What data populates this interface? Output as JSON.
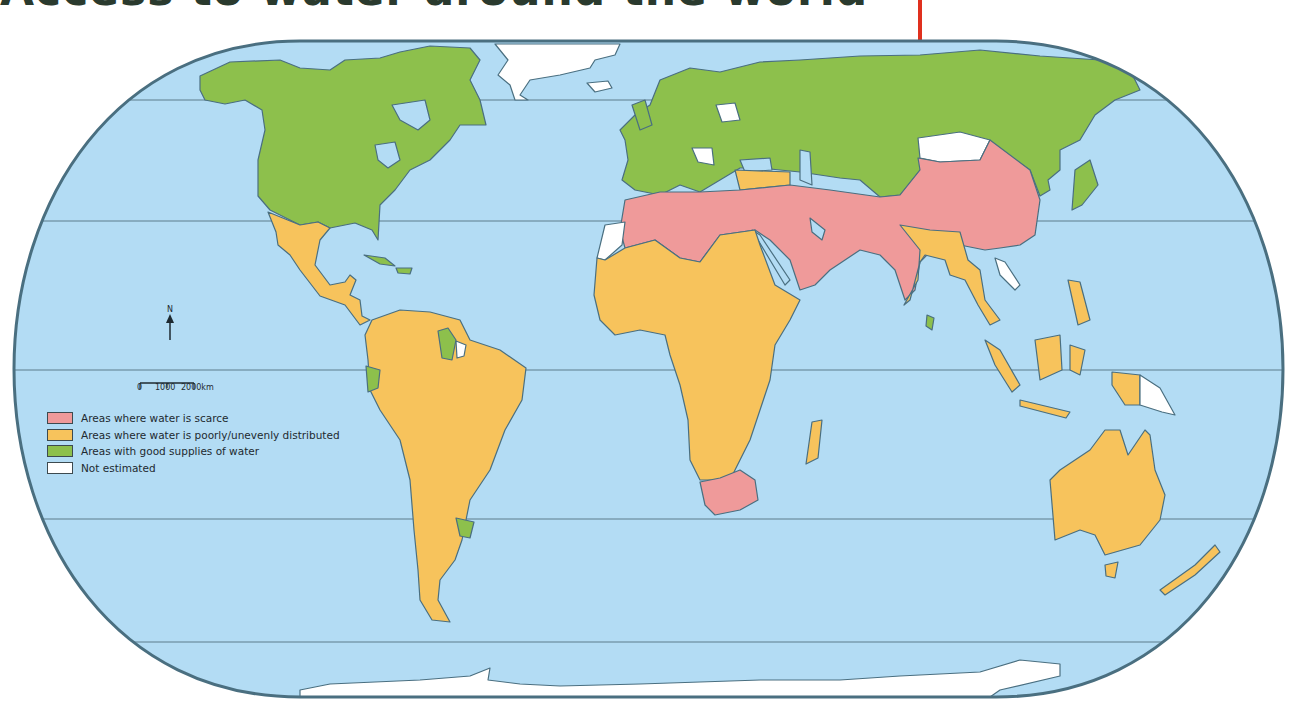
{
  "title": "Access to water around the world",
  "title_rule_color": "#e0301e",
  "map": {
    "projection": "rounded world projection",
    "ocean_color": "#b3dcf4",
    "border_color": "#4a6f80",
    "categories": {
      "scarce": "#ef9a9a",
      "uneven": "#f7c35c",
      "good": "#8dc04c",
      "not_estimated": "#ffffff"
    },
    "regions": {
      "north_america": "good",
      "greenland": "not_estimated",
      "mexico_central_america": "uneven",
      "caribbean": "good",
      "south_america": "uneven",
      "guyana_suriname": "good",
      "french_guiana": "not_estimated",
      "ecuador": "good",
      "uruguay": "good",
      "europe": "good",
      "russia_central_asia": "good",
      "north_africa": "scarce",
      "western_sahara": "not_estimated",
      "sub_saharan_africa": "uneven",
      "south_africa": "scarce",
      "madagascar": "uneven",
      "middle_east": "scarce",
      "turkey": "uneven",
      "south_asia_china": "scarce",
      "mongolia": "not_estimated",
      "india_east": "uneven",
      "sri_lanka": "good",
      "southeast_asia": "uneven",
      "laos": "not_estimated",
      "japan_korea": "good",
      "indonesia_philippines": "uneven",
      "papua_new_guinea": "not_estimated",
      "australia": "uneven",
      "new_zealand": "uneven",
      "antarctica": "not_estimated"
    }
  },
  "legend": {
    "items": [
      {
        "label": "Areas where water is scarce",
        "color": "#ef9a9a"
      },
      {
        "label": "Areas where water is poorly/unevenly distributed",
        "color": "#f7c35c"
      },
      {
        "label": "Areas with good supplies of water",
        "color": "#8dc04c"
      },
      {
        "label": "Not estimated",
        "color": "#ffffff"
      }
    ]
  },
  "north_arrow": {
    "label": "N"
  },
  "scale_bar": {
    "ticks": [
      "0",
      "1000",
      "2000km"
    ]
  }
}
